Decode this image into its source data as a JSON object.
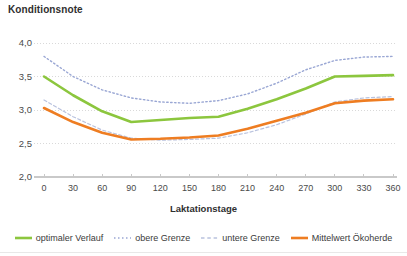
{
  "chart_data": {
    "type": "line",
    "title": "Konditionsnote",
    "xlabel": "Laktationstage",
    "ylabel": "",
    "xlim": [
      0,
      360
    ],
    "ylim": [
      2.0,
      4.0
    ],
    "grid": true,
    "legend_position": "bottom",
    "xticks": [
      0,
      30,
      60,
      90,
      120,
      150,
      180,
      210,
      240,
      270,
      300,
      330,
      360
    ],
    "xtick_labels": [
      "0",
      "30",
      "60",
      "90",
      "120",
      "150",
      "180",
      "210",
      "240",
      "270",
      "300",
      "330",
      "360"
    ],
    "yticks": [
      2.0,
      2.5,
      3.0,
      3.5,
      4.0
    ],
    "ytick_labels": [
      "2,0",
      "2,5",
      "3,0",
      "3,5",
      "4,0"
    ],
    "x": [
      0,
      30,
      60,
      90,
      120,
      150,
      180,
      210,
      240,
      270,
      300,
      330,
      360
    ],
    "series": [
      {
        "name": "optimaler Verlauf",
        "color": "#8CC63E",
        "style": "solid",
        "width": 2.6,
        "values": [
          3.5,
          3.22,
          2.98,
          2.82,
          2.85,
          2.88,
          2.9,
          3.02,
          3.16,
          3.32,
          3.5,
          3.51,
          3.52
        ]
      },
      {
        "name": "obere Grenze",
        "color": "#9AA7D4",
        "style": "dotted",
        "width": 1.4,
        "values": [
          3.8,
          3.5,
          3.3,
          3.18,
          3.12,
          3.1,
          3.14,
          3.24,
          3.4,
          3.6,
          3.74,
          3.79,
          3.8
        ]
      },
      {
        "name": "untere Grenze",
        "color": "#B9C2DE",
        "style": "dashed",
        "width": 1.2,
        "values": [
          3.15,
          2.9,
          2.7,
          2.58,
          2.55,
          2.56,
          2.58,
          2.66,
          2.78,
          2.94,
          3.12,
          3.18,
          3.2
        ]
      },
      {
        "name": "Mittelwert Ökoherde",
        "color": "#EE7D22",
        "style": "solid",
        "width": 2.6,
        "values": [
          3.03,
          2.82,
          2.66,
          2.56,
          2.57,
          2.59,
          2.62,
          2.72,
          2.84,
          2.96,
          3.1,
          3.14,
          3.16
        ]
      }
    ]
  },
  "legend": {
    "items": [
      {
        "label": "optimaler Verlauf",
        "color": "#8CC63E",
        "style": "solid"
      },
      {
        "label": "obere Grenze",
        "color": "#9AA7D4",
        "style": "dotted"
      },
      {
        "label": "untere Grenze",
        "color": "#B9C2DE",
        "style": "dashed"
      },
      {
        "label": "Mittelwert Ökoherde",
        "color": "#EE7D22",
        "style": "solid"
      }
    ]
  },
  "colors": {
    "grid": "#d9d9d9",
    "axis": "#c9c9c9",
    "text": "#4a4a4a",
    "background": "#ffffff"
  }
}
